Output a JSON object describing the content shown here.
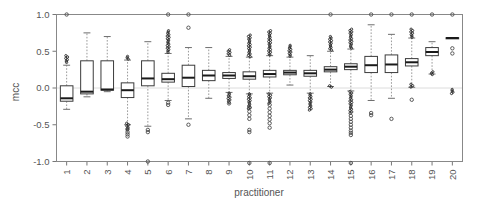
{
  "chart_data": {
    "type": "box",
    "title": "",
    "xlabel": "practitioner",
    "ylabel": "mcc",
    "ylim": [
      -1.0,
      1.0
    ],
    "xlim": [
      0.5,
      20.5
    ],
    "grid": false,
    "legend": null,
    "ytick_labels": [
      "1.0",
      "0.5",
      "0.0",
      "-0.5",
      "-1.0"
    ],
    "ytick_values": [
      1.0,
      0.5,
      0.0,
      -0.5,
      -1.0
    ],
    "xtick_labels": [
      "1",
      "2",
      "3",
      "4",
      "5",
      "6",
      "7",
      "8",
      "9",
      "10",
      "11",
      "12",
      "13",
      "14",
      "15",
      "16",
      "17",
      "18",
      "19",
      "20"
    ],
    "categories": [
      1,
      2,
      3,
      4,
      5,
      6,
      7,
      8,
      9,
      10,
      11,
      12,
      13,
      14,
      15,
      16,
      17,
      18,
      19,
      20
    ],
    "boxes": [
      {
        "x": 1,
        "q1": -0.18,
        "median": -0.14,
        "q3": 0.03,
        "whisker_low": -0.29,
        "whisker_high": 0.31,
        "outliers": [
          1.0
        ],
        "dense_low": null,
        "dense_high": [
          0.33,
          0.44
        ]
      },
      {
        "x": 2,
        "q1": -0.08,
        "median": -0.05,
        "q3": 0.37,
        "whisker_low": -0.12,
        "whisker_high": 0.75,
        "outliers": [],
        "dense_low": null,
        "dense_high": null
      },
      {
        "x": 3,
        "q1": -0.03,
        "median": -0.02,
        "q3": 0.37,
        "whisker_low": -0.05,
        "whisker_high": 0.7,
        "outliers": [],
        "dense_low": null,
        "dense_high": null
      },
      {
        "x": 4,
        "q1": -0.13,
        "median": -0.03,
        "q3": 0.07,
        "whisker_low": -0.5,
        "whisker_high": 0.38,
        "outliers": [
          -0.56,
          -0.6,
          -0.63,
          -0.66
        ],
        "dense_low": [
          -0.58,
          -0.48
        ],
        "dense_high": [
          0.39,
          0.43
        ]
      },
      {
        "x": 5,
        "q1": 0.03,
        "median": 0.13,
        "q3": 0.37,
        "whisker_low": -0.52,
        "whisker_high": 0.63,
        "outliers": [
          -1.0,
          -0.6,
          -0.57
        ],
        "dense_low": null,
        "dense_high": null
      },
      {
        "x": 6,
        "q1": 0.08,
        "median": 0.12,
        "q3": 0.2,
        "whisker_low": -0.17,
        "whisker_high": 0.47,
        "outliers": [
          1.0,
          -0.2,
          -0.23
        ],
        "dense_low": null,
        "dense_high": [
          0.47,
          0.78
        ]
      },
      {
        "x": 7,
        "q1": 0.02,
        "median": 0.14,
        "q3": 0.31,
        "whisker_low": -0.42,
        "whisker_high": 0.55,
        "outliers": [
          1.0,
          0.82,
          -0.5
        ],
        "dense_low": null,
        "dense_high": null
      },
      {
        "x": 8,
        "q1": 0.1,
        "median": 0.17,
        "q3": 0.24,
        "whisker_low": -0.14,
        "whisker_high": 0.55,
        "outliers": [],
        "dense_low": null,
        "dense_high": null
      },
      {
        "x": 9,
        "q1": 0.13,
        "median": 0.17,
        "q3": 0.21,
        "whisker_low": -0.06,
        "whisker_high": 0.43,
        "outliers": [
          -0.21
        ],
        "dense_low": [
          -0.21,
          -0.07
        ],
        "dense_high": [
          0.43,
          0.52
        ]
      },
      {
        "x": 10,
        "q1": 0.12,
        "median": 0.16,
        "q3": 0.22,
        "whisker_low": -0.08,
        "whisker_high": 0.42,
        "outliers": [
          -1.02,
          -0.6,
          -0.57,
          -0.42,
          -0.37,
          -0.32,
          -0.27
        ],
        "dense_low": [
          -0.3,
          -0.08
        ],
        "dense_high": [
          0.42,
          0.72
        ]
      },
      {
        "x": 11,
        "q1": 0.15,
        "median": 0.19,
        "q3": 0.24,
        "whisker_low": -0.07,
        "whisker_high": 0.44,
        "outliers": [
          -1.02,
          -0.54,
          -0.48,
          -0.43,
          -0.38,
          -0.33,
          -0.28,
          -0.23
        ],
        "dense_low": [
          -0.22,
          -0.08
        ],
        "dense_high": [
          0.44,
          0.78
        ]
      },
      {
        "x": 12,
        "q1": 0.18,
        "median": 0.21,
        "q3": 0.24,
        "whisker_low": 0.04,
        "whisker_high": 0.42,
        "outliers": [],
        "dense_low": null,
        "dense_high": [
          0.42,
          0.58
        ]
      },
      {
        "x": 13,
        "q1": 0.16,
        "median": 0.2,
        "q3": 0.24,
        "whisker_low": -0.07,
        "whisker_high": 0.44,
        "outliers": [],
        "dense_low": [
          -0.31,
          -0.08
        ],
        "dense_high": null
      },
      {
        "x": 14,
        "q1": 0.22,
        "median": 0.25,
        "q3": 0.29,
        "whisker_low": 0.02,
        "whisker_high": 0.5,
        "outliers": [
          1.0
        ],
        "dense_low": [
          0.0,
          0.03
        ],
        "dense_high": [
          0.5,
          0.7
        ]
      },
      {
        "x": 15,
        "q1": 0.25,
        "median": 0.29,
        "q3": 0.33,
        "whisker_low": -0.04,
        "whisker_high": 0.53,
        "outliers": [
          -1.02,
          -0.64,
          -0.61,
          -0.58,
          -0.54,
          -0.5,
          -0.46,
          -0.42,
          -0.38
        ],
        "dense_low": [
          -0.36,
          -0.05
        ],
        "dense_high": [
          0.53,
          0.8
        ]
      },
      {
        "x": 16,
        "q1": 0.21,
        "median": 0.31,
        "q3": 0.43,
        "whisker_low": -0.17,
        "whisker_high": 0.86,
        "outliers": [
          1.0,
          -0.34,
          -0.37
        ],
        "dense_low": null,
        "dense_high": null
      },
      {
        "x": 17,
        "q1": 0.21,
        "median": 0.32,
        "q3": 0.45,
        "whisker_low": -0.14,
        "whisker_high": 0.73,
        "outliers": [
          1.0,
          -0.42
        ],
        "dense_low": null,
        "dense_high": null
      },
      {
        "x": 18,
        "q1": 0.3,
        "median": 0.35,
        "q3": 0.4,
        "whisker_low": 0.01,
        "whisker_high": 0.68,
        "outliers": [
          1.0,
          -0.16
        ],
        "dense_low": [
          0.0,
          0.05
        ],
        "dense_high": [
          0.68,
          0.8
        ]
      },
      {
        "x": 19,
        "q1": 0.44,
        "median": 0.49,
        "q3": 0.55,
        "whisker_low": 0.19,
        "whisker_high": 0.63,
        "outliers": [
          1.0
        ],
        "dense_low": [
          0.17,
          0.22
        ],
        "dense_high": null
      },
      {
        "x": 20,
        "q1": 0.675,
        "median": 0.68,
        "q3": 0.685,
        "whisker_low": 0.675,
        "whisker_high": 0.685,
        "outliers": [
          1.0,
          0.54,
          0.47
        ],
        "dense_low": [
          -0.08,
          -0.02
        ],
        "dense_high": null
      }
    ]
  },
  "colors": {
    "background": "#ffffff",
    "frame": "#888888",
    "box_stroke": "#3b3b3b",
    "median": "#1a1a1a",
    "whisker": "#9a9a9a",
    "outlier": "#4a4a4a",
    "text": "#555555",
    "zero_line": "#dcdcdc"
  }
}
